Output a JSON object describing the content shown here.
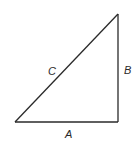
{
  "diagram": {
    "type": "right-triangle",
    "vertices": {
      "top": [
        118,
        14
      ],
      "bottom_left": [
        15,
        122
      ],
      "bottom_right": [
        118,
        122
      ]
    },
    "labels": {
      "hypotenuse": "C",
      "vertical_side": "B",
      "horizontal_side": "A"
    },
    "stroke_color": "#2a2a2a",
    "background": "#ffffff"
  }
}
